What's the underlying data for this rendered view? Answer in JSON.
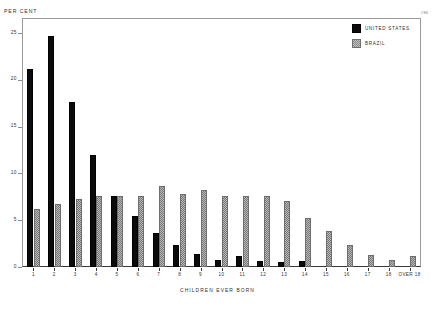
{
  "chart_data": {
    "type": "bar",
    "title": "",
    "ylabel": "PER CENT",
    "xlabel": "CHILDREN EVER BORN",
    "ylim": [
      0,
      26.5
    ],
    "yticks": [
      0,
      5,
      10,
      15,
      20,
      25
    ],
    "ytick_labels": [
      "0",
      "5",
      "10",
      "15",
      "20",
      "25"
    ],
    "grid": false,
    "legend_position": "top-right",
    "categories": [
      "1",
      "2",
      "3",
      "4",
      "5",
      "6",
      "7",
      "8",
      "9",
      "10",
      "11",
      "12",
      "13",
      "14",
      "15",
      "16",
      "17",
      "18",
      "OVER 18"
    ],
    "series": [
      {
        "name": "UNITED STATES",
        "color": "#0b0b0b",
        "values": [
          21.2,
          24.7,
          17.6,
          12.0,
          7.6,
          5.5,
          3.6,
          2.3,
          1.4,
          0.7,
          1.2,
          0.6,
          0.5,
          0.6,
          0.0,
          0.0,
          0.0,
          0.0,
          0.0
        ]
      },
      {
        "name": "BRAZIL",
        "color": "#b6b6b6",
        "values": [
          6.2,
          6.7,
          7.3,
          7.6,
          7.6,
          7.6,
          8.7,
          7.8,
          8.2,
          7.6,
          7.6,
          7.6,
          7.1,
          5.2,
          3.8,
          2.4,
          1.3,
          0.8,
          1.2
        ]
      }
    ]
  },
  "annotations": {
    "corner_mark": "#90"
  }
}
